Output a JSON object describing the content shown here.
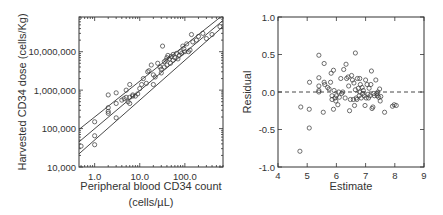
{
  "chart_data": [
    {
      "type": "scatter",
      "title": "",
      "xlabel": "Peripheral blood CD34 count",
      "xlabel_units": "(cells/µL)",
      "ylabel": "Harvested CD34 dose (cells/Kg)",
      "xscale": "log",
      "yscale": "log",
      "xlim": [
        0.45,
        700
      ],
      "ylim": [
        10000,
        80000000
      ],
      "x_ticks": [
        {
          "value": 1,
          "label": "1.0"
        },
        {
          "value": 10,
          "label": "10.0"
        },
        {
          "value": 100,
          "label": "100.0"
        }
      ],
      "y_ticks": [
        {
          "value": 10000,
          "label": "10,000"
        },
        {
          "value": 100000,
          "label": "100,000"
        },
        {
          "value": 1000000,
          "label": "1,000,000"
        },
        {
          "value": 10000000,
          "label": "10,000,000"
        }
      ],
      "lines": [
        {
          "name": "upper-bound",
          "x": [
            0.45,
            700
          ],
          "y": [
            95000,
            90000000
          ]
        },
        {
          "name": "regression-fit",
          "x": [
            0.45,
            700
          ],
          "y": [
            45000,
            65000000
          ]
        },
        {
          "name": "lower-bound",
          "x": [
            0.45,
            700
          ],
          "y": [
            22000,
            45000000
          ]
        }
      ],
      "points": [
        [
          0.5,
          35000
        ],
        [
          1.0,
          38000
        ],
        [
          1.0,
          65000
        ],
        [
          1.0,
          150000
        ],
        [
          2.0,
          250000
        ],
        [
          2.0,
          280000
        ],
        [
          2.0,
          350000
        ],
        [
          2.0,
          750000
        ],
        [
          3.0,
          190000
        ],
        [
          3.0,
          450000
        ],
        [
          3.0,
          850000
        ],
        [
          4.0,
          550000
        ],
        [
          4.5,
          600000
        ],
        [
          5.0,
          650000
        ],
        [
          5.0,
          1000000
        ],
        [
          5.5,
          500000
        ],
        [
          6.0,
          450000
        ],
        [
          6.0,
          650000
        ],
        [
          6.0,
          1400000
        ],
        [
          7.0,
          750000
        ],
        [
          7.0,
          700000
        ],
        [
          8.0,
          700000
        ],
        [
          9.0,
          800000
        ],
        [
          10.0,
          1100000
        ],
        [
          11.0,
          1400000
        ],
        [
          12.0,
          2000000
        ],
        [
          14.0,
          1500000
        ],
        [
          15.0,
          3000000
        ],
        [
          16.0,
          3200000
        ],
        [
          18.0,
          4500000
        ],
        [
          20.0,
          1400000
        ],
        [
          20.0,
          2500000
        ],
        [
          22.0,
          2200000
        ],
        [
          25.0,
          5000000
        ],
        [
          28.0,
          4000000
        ],
        [
          30.0,
          2800000
        ],
        [
          30.0,
          3500000
        ],
        [
          32.0,
          14000000
        ],
        [
          35.0,
          4000000
        ],
        [
          35.0,
          5500000
        ],
        [
          38.0,
          6000000
        ],
        [
          40.0,
          4500000
        ],
        [
          40.0,
          7000000
        ],
        [
          42.0,
          8000000
        ],
        [
          45.0,
          6500000
        ],
        [
          48.0,
          5000000
        ],
        [
          50.0,
          7500000
        ],
        [
          55.0,
          6000000
        ],
        [
          55.0,
          8500000
        ],
        [
          60.0,
          7000000
        ],
        [
          65.0,
          9000000
        ],
        [
          70.0,
          6500000
        ],
        [
          75.0,
          8000000
        ],
        [
          80.0,
          10000000
        ],
        [
          85.0,
          9000000
        ],
        [
          90.0,
          14000000
        ],
        [
          95.0,
          12000000
        ],
        [
          100.0,
          10000000
        ],
        [
          110.0,
          16000000
        ],
        [
          120.0,
          10000000
        ],
        [
          130.0,
          11000000
        ],
        [
          140.0,
          28000000
        ],
        [
          150.0,
          18000000
        ],
        [
          180.0,
          20000000
        ],
        [
          200.0,
          25000000
        ],
        [
          250.0,
          30000000
        ],
        [
          300.0,
          22000000
        ],
        [
          400.0,
          28000000
        ],
        [
          600.0,
          45000000
        ]
      ]
    },
    {
      "type": "scatter",
      "title": "",
      "xlabel": "Estimate",
      "ylabel": "Residual",
      "xlim": [
        4,
        9
      ],
      "ylim": [
        -1.0,
        1.0
      ],
      "x_ticks": [
        {
          "value": 4,
          "label": "4"
        },
        {
          "value": 5,
          "label": "5"
        },
        {
          "value": 6,
          "label": "6"
        },
        {
          "value": 7,
          "label": "7"
        },
        {
          "value": 8,
          "label": "8"
        },
        {
          "value": 9,
          "label": "9"
        }
      ],
      "y_ticks": [
        {
          "value": 1.0,
          "label": "1.0"
        },
        {
          "value": 0.5,
          "label": "0.5"
        },
        {
          "value": 0.0,
          "label": "0.0"
        },
        {
          "value": -0.5,
          "label": "-0.5"
        },
        {
          "value": -1.0,
          "label": "-1.0"
        }
      ],
      "reference_line": {
        "y": 0.0,
        "style": "dashed"
      },
      "points": [
        [
          4.75,
          -0.79
        ],
        [
          4.78,
          -0.2
        ],
        [
          5.07,
          -0.48
        ],
        [
          5.07,
          -0.23
        ],
        [
          5.08,
          0.13
        ],
        [
          5.4,
          0.49
        ],
        [
          5.4,
          0.19
        ],
        [
          5.4,
          0.08
        ],
        [
          5.4,
          0.02
        ],
        [
          5.4,
          0.0
        ],
        [
          5.55,
          -0.27
        ],
        [
          5.58,
          0.38
        ],
        [
          5.58,
          0.13
        ],
        [
          5.6,
          0.1
        ],
        [
          5.7,
          0.06
        ],
        [
          5.75,
          0.04
        ],
        [
          5.8,
          0.13
        ],
        [
          5.82,
          0.25
        ],
        [
          5.85,
          -0.05
        ],
        [
          5.85,
          -0.1
        ],
        [
          5.9,
          -0.23
        ],
        [
          5.9,
          0.29
        ],
        [
          5.92,
          0.02
        ],
        [
          5.95,
          -0.08
        ],
        [
          5.98,
          -0.12
        ],
        [
          6.0,
          -0.05
        ],
        [
          6.05,
          -0.17
        ],
        [
          6.08,
          0.0
        ],
        [
          6.1,
          -0.07
        ],
        [
          6.15,
          0.18
        ],
        [
          6.18,
          -0.02
        ],
        [
          6.22,
          0.0
        ],
        [
          6.25,
          0.3
        ],
        [
          6.3,
          -0.08
        ],
        [
          6.33,
          0.37
        ],
        [
          6.35,
          0.18
        ],
        [
          6.4,
          0.2
        ],
        [
          6.42,
          0.08
        ],
        [
          6.45,
          -0.25
        ],
        [
          6.48,
          -0.1
        ],
        [
          6.52,
          0.22
        ],
        [
          6.55,
          0.16
        ],
        [
          6.58,
          -0.1
        ],
        [
          6.6,
          0.12
        ],
        [
          6.62,
          -0.18
        ],
        [
          6.65,
          0.52
        ],
        [
          6.65,
          0.03
        ],
        [
          6.68,
          -0.08
        ],
        [
          6.7,
          -0.1
        ],
        [
          6.72,
          0.18
        ],
        [
          6.75,
          0.05
        ],
        [
          6.78,
          -0.05
        ],
        [
          6.8,
          0.18
        ],
        [
          6.8,
          0.0
        ],
        [
          6.82,
          0.1
        ],
        [
          6.85,
          -0.08
        ],
        [
          6.88,
          0.06
        ],
        [
          6.9,
          -0.02
        ],
        [
          6.92,
          0.02
        ],
        [
          6.95,
          -0.05
        ],
        [
          6.98,
          -0.18
        ],
        [
          7.0,
          0.16
        ],
        [
          7.02,
          -0.08
        ],
        [
          7.05,
          0.1
        ],
        [
          7.08,
          -0.03
        ],
        [
          7.1,
          -0.08
        ],
        [
          7.12,
          0.05
        ],
        [
          7.15,
          -0.05
        ],
        [
          7.18,
          0.1
        ],
        [
          7.2,
          0.28
        ],
        [
          7.22,
          -0.22
        ],
        [
          7.25,
          -0.2
        ],
        [
          7.28,
          -0.02
        ],
        [
          7.3,
          -0.05
        ],
        [
          7.35,
          0.16
        ],
        [
          7.38,
          -0.02
        ],
        [
          7.4,
          -0.05
        ],
        [
          7.42,
          0.0
        ],
        [
          7.45,
          -0.07
        ],
        [
          7.48,
          0.04
        ],
        [
          7.5,
          -0.12
        ],
        [
          7.52,
          -0.06
        ],
        [
          7.65,
          -0.27
        ],
        [
          7.92,
          -0.19
        ],
        [
          7.98,
          -0.17
        ],
        [
          8.05,
          -0.18
        ]
      ]
    }
  ]
}
